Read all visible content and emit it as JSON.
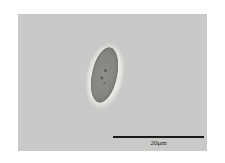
{
  "image": {
    "type": "micrograph",
    "subject": "single elongated ellipsoid cell",
    "background_color": "#c9c9c7"
  },
  "scale_bar": {
    "label": "20μm",
    "color": "#1a1a1a"
  }
}
